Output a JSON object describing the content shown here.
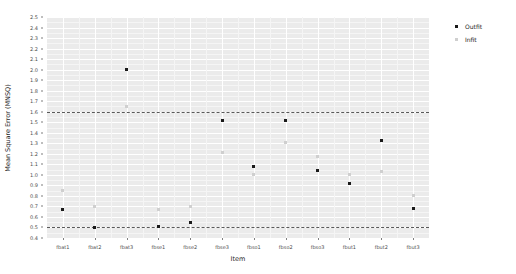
{
  "chart_data": {
    "type": "scatter",
    "title": "",
    "xlabel": "Item",
    "ylabel": "Mean Square Error (MNSQ)",
    "categories": [
      "fbat1",
      "fbat2",
      "fbat3",
      "fbse1",
      "fbse2",
      "fbse3",
      "fbso1",
      "fbso2",
      "fbso3",
      "fbut1",
      "fbut2",
      "fbut3"
    ],
    "ylim": [
      0.4,
      2.5
    ],
    "ytick_labels": [
      "0.4",
      "0.5",
      "0.6",
      "0.7",
      "0.8",
      "0.9",
      "1.0",
      "1.1",
      "1.2",
      "1.3",
      "1.4",
      "1.5",
      "1.6",
      "1.7",
      "1.8",
      "1.9",
      "2.0",
      "2.1",
      "2.2",
      "2.3",
      "2.4",
      "2.5"
    ],
    "ytick_values": [
      0.4,
      0.5,
      0.6,
      0.7,
      0.8,
      0.9,
      1.0,
      1.1,
      1.2,
      1.3,
      1.4,
      1.5,
      1.6,
      1.7,
      1.8,
      1.9,
      2.0,
      2.1,
      2.2,
      2.3,
      2.4,
      2.5
    ],
    "grid": true,
    "legend_position": "right",
    "series": [
      {
        "name": "Outfit",
        "color": "#1a1a1a",
        "marker": "filled-square",
        "values": [
          0.67,
          0.5,
          2.0,
          0.51,
          0.55,
          1.52,
          1.08,
          1.52,
          1.04,
          0.92,
          1.33,
          0.68
        ]
      },
      {
        "name": "Infit",
        "color": "#cfcfcf",
        "marker": "light-square",
        "values": [
          0.85,
          0.7,
          1.65,
          0.67,
          0.7,
          1.21,
          1.0,
          1.31,
          1.17,
          1.0,
          1.03,
          0.8
        ]
      }
    ],
    "reference_lines": [
      {
        "name": "lower-reference-line",
        "value": 0.5,
        "style": "dashed"
      },
      {
        "name": "upper-reference-line",
        "value": 1.6,
        "style": "dashed"
      }
    ]
  },
  "legend": {
    "entries": [
      {
        "label": "Outfit"
      },
      {
        "label": "Infit"
      }
    ]
  }
}
